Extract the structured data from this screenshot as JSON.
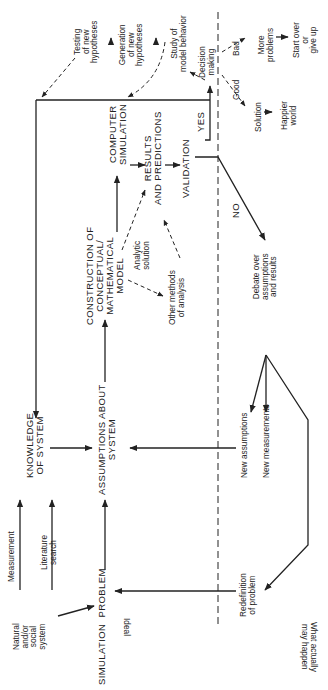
{
  "orientation": "rotated 90 degrees counter-clockwise",
  "zones": {
    "ideal": "Ideal",
    "actual": "What actually\nmay happen"
  },
  "nodes": {
    "natural_system": "Natural\nand/or\nsocial\nsystem",
    "measurement": "Measurement",
    "literature_search": "Literature\nsearch",
    "simulation_problem": "SIMULATION  PROBLEM",
    "knowledge_of_system": "KNOWLEDGE\nOF SYSTEM",
    "assumptions_about_system": "ASSUMPTIONS ABOUT\nSYSTEM",
    "construction_model": "CONSTRUCTION OF\nCONCEPTUAL/\nMATHEMATICAL\nMODEL",
    "analytic_solution": "Analytic\nsolution",
    "other_methods": "Other methods\nof analysis",
    "computer_simulation": "COMPUTER\nSIMULATION",
    "results_predictions": "RESULTS\nAND PREDICTIONS",
    "validation": "VALIDATION",
    "yes": "YES",
    "no": "NO",
    "testing_hypotheses": "Testing\nof new\nhypotheses",
    "generation_hypotheses": "Generation\nof new\nhypotheses",
    "study_model_behavior": "Study of\nmodel behavior",
    "decision_making": "Decision\nmaking",
    "good": "Good",
    "bad": "Bad",
    "solution": "Solution",
    "happier_world": "Happier\nworld",
    "more_problems": "More\nproblems",
    "start_over": "Start over\nor\ngive up",
    "debate": "Debate over\nassumptions\nand results",
    "new_assumptions": "New assumptions",
    "new_measurements": "New measurements",
    "redefinition": "Redefinition\nof problem"
  }
}
